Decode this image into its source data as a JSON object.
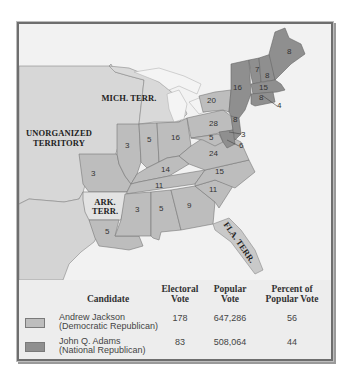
{
  "map": {
    "colors": {
      "background": "#ededed",
      "territory": "#d7d7d7",
      "jackson": "#bdbdbd",
      "adams": "#8f8f8f",
      "water": "#f4f4f4",
      "florida": "#c9c9c9"
    },
    "territory_labels": {
      "unorganized": [
        "UNORGANIZED",
        "TERRITORY"
      ],
      "mich": "MICH. TERR.",
      "ark": [
        "ARK.",
        "TERR."
      ],
      "fla": "FLA. TERR."
    },
    "states": [
      {
        "name": "Maine",
        "votes": "8",
        "party": "adams"
      },
      {
        "name": "New Hampshire",
        "votes": "8",
        "party": "adams"
      },
      {
        "name": "Vermont",
        "votes": "7",
        "party": "adams"
      },
      {
        "name": "Massachusetts",
        "votes": "15",
        "party": "adams"
      },
      {
        "name": "Rhode Island",
        "votes": "4",
        "party": "adams"
      },
      {
        "name": "Connecticut",
        "votes": "8",
        "party": "adams"
      },
      {
        "name": "New York",
        "votes": "16",
        "party": "adams"
      },
      {
        "name": "New York",
        "votes": "20",
        "party": "jackson"
      },
      {
        "name": "New Jersey",
        "votes": "8",
        "party": "adams"
      },
      {
        "name": "Delaware",
        "votes": "3",
        "party": "adams"
      },
      {
        "name": "Maryland",
        "votes": "6",
        "party": "adams"
      },
      {
        "name": "Maryland",
        "votes": "5",
        "party": "jackson"
      },
      {
        "name": "Pennsylvania",
        "votes": "28",
        "party": "jackson"
      },
      {
        "name": "Virginia",
        "votes": "24",
        "party": "jackson"
      },
      {
        "name": "North Carolina",
        "votes": "15",
        "party": "jackson"
      },
      {
        "name": "South Carolina",
        "votes": "11",
        "party": "jackson"
      },
      {
        "name": "Georgia",
        "votes": "9",
        "party": "jackson"
      },
      {
        "name": "Alabama",
        "votes": "5",
        "party": "jackson"
      },
      {
        "name": "Mississippi",
        "votes": "3",
        "party": "jackson"
      },
      {
        "name": "Louisiana",
        "votes": "5",
        "party": "jackson"
      },
      {
        "name": "Tennessee",
        "votes": "11",
        "party": "jackson"
      },
      {
        "name": "Kentucky",
        "votes": "14",
        "party": "jackson"
      },
      {
        "name": "Ohio",
        "votes": "16",
        "party": "jackson"
      },
      {
        "name": "Indiana",
        "votes": "5",
        "party": "jackson"
      },
      {
        "name": "Illinois",
        "votes": "3",
        "party": "jackson"
      },
      {
        "name": "Missouri",
        "votes": "3",
        "party": "jackson"
      }
    ]
  },
  "legend": {
    "headers": {
      "candidate": "Candidate",
      "electoral_1": "Electoral",
      "electoral_2": "Vote",
      "popular_1": "Popular",
      "popular_2": "Vote",
      "percent_1": "Percent of",
      "percent_2": "Popular Vote"
    },
    "rows": [
      {
        "name": "Andrew Jackson",
        "party": "(Democratic Republican)",
        "electoral": "178",
        "popular": "647,286",
        "percent": "56",
        "swatch": "#bdbdbd"
      },
      {
        "name": "John Q. Adams",
        "party": "(National Republican)",
        "electoral": "83",
        "popular": "508,064",
        "percent": "44",
        "swatch": "#8f8f8f"
      }
    ]
  }
}
